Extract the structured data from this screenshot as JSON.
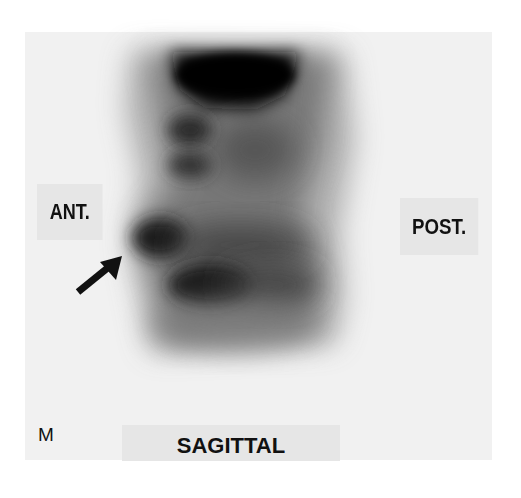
{
  "image": {
    "type": "nuclear-medicine-bone-scan",
    "view": "SAGITTAL",
    "labels": {
      "anterior": "ANT.",
      "posterior": "POST.",
      "view": "SAGITTAL",
      "marker": "M"
    },
    "annotation": {
      "type": "arrow",
      "direction": "up-right",
      "points_to": "anterior focal uptake"
    },
    "colors": {
      "background": "#ffffff",
      "panel": "#f1f1f1",
      "label_box": "#e6e6e6",
      "text": "#111111",
      "uptake_dark": "#0a0a0a"
    }
  }
}
